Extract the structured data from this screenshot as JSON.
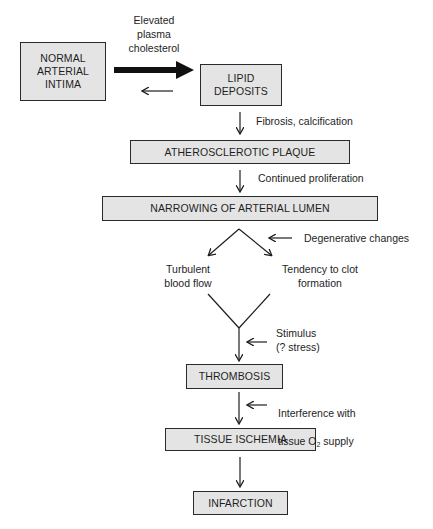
{
  "diagram": {
    "boxes": {
      "normal": "NORMAL\nARTERIAL\nINTIMA",
      "lipid": "LIPID\nDEPOSITS",
      "plaque": "ATHEROSCLEROTIC PLAQUE",
      "narrowing": "NARROWING OF ARTERIAL LUMEN",
      "thrombosis": "THROMBOSIS",
      "ischemia": "TISSUE ISCHEMIA",
      "infarction": "INFARCTION"
    },
    "labels": {
      "cholesterol": "Elevated\nplasma\ncholesterol",
      "fibrosis": "Fibrosis, calcification",
      "proliferation": "Continued proliferation",
      "degenerative": "Degenerative changes",
      "turbulent": "Turbulent\nblood flow",
      "clot": "Tendency to clot\nformation",
      "stimulus": "Stimulus\n(? stress)",
      "interference_line1": "Interference with",
      "interference_line2_prefix": "tissue O",
      "interference_sub": "2",
      "interference_line2_suffix": " supply"
    },
    "colors": {
      "box_fill": "#e4e4e4",
      "stroke": "#1e1e1e"
    }
  }
}
